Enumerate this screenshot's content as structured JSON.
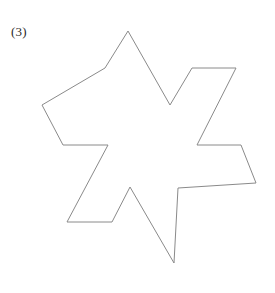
{
  "figure": {
    "label": "(3)",
    "caption_position": "top-left",
    "background_color": "#ffffff",
    "shape": {
      "name": "six-pointed-star-polygon",
      "description": "Concave 6-pointed star outline (hexagram-like) drawn with thin gray strokes on white background",
      "stroke_color": "#8a8a8a",
      "fill_color": "#ffffff",
      "stroke_width": 1,
      "closed": true,
      "vertex_count": 16,
      "points": [
        [
          128,
          31
        ],
        [
          170,
          105
        ],
        [
          192,
          68
        ],
        [
          236,
          68
        ],
        [
          197,
          145
        ],
        [
          241,
          145
        ],
        [
          256,
          183
        ],
        [
          178,
          188
        ],
        [
          174,
          263
        ],
        [
          130,
          187
        ],
        [
          112,
          222
        ],
        [
          67,
          222
        ],
        [
          108,
          145
        ],
        [
          63,
          145
        ],
        [
          42,
          105
        ],
        [
          105,
          68
        ]
      ],
      "points_string": "128,31 170,105 192,68 236,68 197,145 241,145 256,183 178,188 174,263 130,187 112,222 67,222 108,145 63,145 42,105 105,68"
    }
  },
  "canvas": {
    "width": 275,
    "height": 293
  }
}
